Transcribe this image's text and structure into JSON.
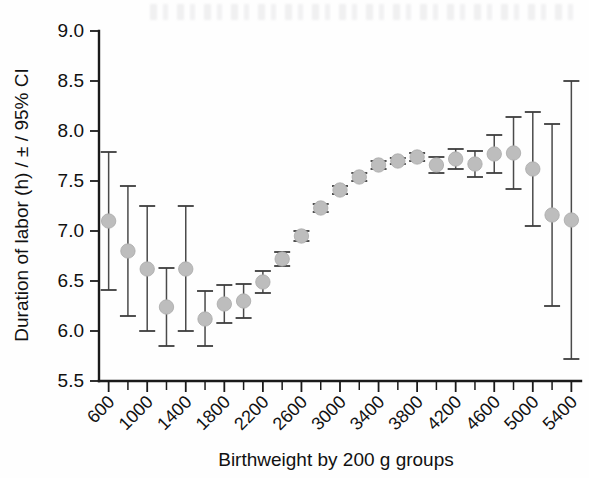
{
  "chart_data": {
    "type": "scatter",
    "title": "",
    "xlabel": "Birthweight by 200 g groups",
    "ylabel": "Duration of labor (h) / ± / 95% CI",
    "xlim": [
      500,
      5500
    ],
    "ylim": [
      5.5,
      9.0
    ],
    "ytick_labels": [
      "9.0",
      "8.5",
      "8.0",
      "7.5",
      "7.0",
      "6.5",
      "6.0",
      "5.5"
    ],
    "ytick_values": [
      9.0,
      8.5,
      8.0,
      7.5,
      7.0,
      6.5,
      6.0,
      5.5
    ],
    "xtick_labels": [
      "600",
      "1000",
      "1400",
      "1800",
      "2200",
      "2600",
      "3000",
      "3400",
      "3800",
      "4200",
      "4600",
      "5000",
      "5400"
    ],
    "xtick_values": [
      600,
      1000,
      1400,
      1800,
      2200,
      2600,
      3000,
      3400,
      3800,
      4200,
      4600,
      5000,
      5400
    ],
    "xtick_minor_values": [
      800,
      1200,
      1600,
      2000,
      2400,
      2800,
      3200,
      3600,
      4000,
      4400,
      4800,
      5200
    ],
    "grid": false,
    "legend": false,
    "error_type": "95% CI",
    "marker_color": "#bdbdbd",
    "errorbar_color": "#4a4a4a",
    "categories": [
      600,
      800,
      1000,
      1200,
      1400,
      1600,
      1800,
      2000,
      2200,
      2400,
      2600,
      2800,
      3000,
      3200,
      3400,
      3600,
      3800,
      4000,
      4200,
      4400,
      4600,
      4800,
      5000,
      5200,
      5400
    ],
    "values": [
      7.1,
      6.8,
      6.62,
      6.24,
      6.62,
      6.12,
      6.27,
      6.3,
      6.49,
      6.72,
      6.95,
      7.23,
      7.41,
      7.54,
      7.66,
      7.7,
      7.74,
      7.66,
      7.72,
      7.67,
      7.77,
      7.78,
      7.62,
      7.16,
      7.11
    ],
    "ci_low": [
      6.41,
      6.15,
      6.0,
      5.85,
      6.0,
      5.85,
      6.08,
      6.13,
      6.38,
      6.65,
      6.9,
      7.19,
      7.37,
      7.5,
      7.62,
      7.67,
      7.7,
      7.58,
      7.62,
      7.54,
      7.58,
      7.42,
      7.05,
      6.25,
      5.72
    ],
    "ci_high": [
      7.79,
      7.45,
      7.25,
      6.63,
      7.25,
      6.4,
      6.46,
      6.47,
      6.6,
      6.79,
      7.0,
      7.27,
      7.45,
      7.58,
      7.7,
      7.73,
      7.78,
      7.74,
      7.82,
      7.8,
      7.96,
      8.14,
      8.19,
      8.07,
      8.5
    ]
  }
}
